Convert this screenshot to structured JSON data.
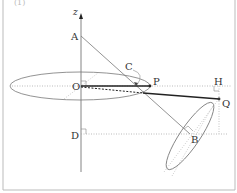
{
  "caption": "(1)",
  "axis": {
    "label": "z"
  },
  "points": {
    "A": "A",
    "O": "O",
    "C": "C",
    "P": "P",
    "H": "H",
    "Q": "Q",
    "D": "D",
    "B": "B"
  },
  "colors": {
    "line": "#444444",
    "thin": "#888888",
    "dotted": "#aaaaaa",
    "frame": "#bbbbbb"
  }
}
